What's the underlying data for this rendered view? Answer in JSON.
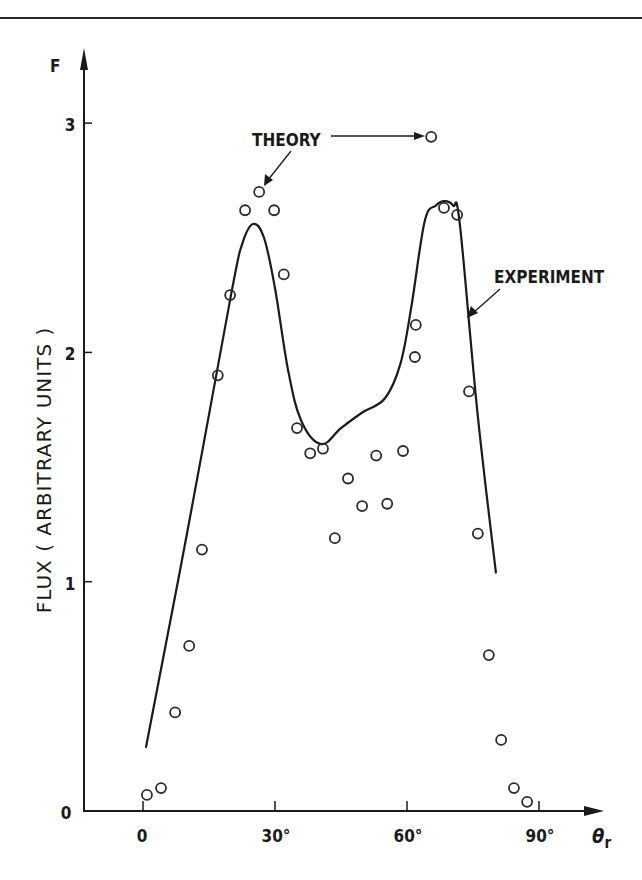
{
  "chart_data": {
    "type": "scatter",
    "title": "",
    "xlabel": "θr",
    "ylabel": "FLUX ( ARBITRARY UNITS )",
    "y_axis_symbol": "F",
    "xlim": [
      -13,
      96
    ],
    "ylim": [
      0,
      3.3
    ],
    "x_ticks": [
      0,
      30,
      60,
      90
    ],
    "x_tick_labels": [
      "0",
      "30°",
      "60°",
      "90°"
    ],
    "y_ticks": [
      0,
      1,
      2,
      3
    ],
    "y_tick_labels": [
      "0",
      "1",
      "2",
      "3"
    ],
    "grid": false,
    "legend": "none (inline annotations)",
    "annotations": [
      {
        "text": "THEORY",
        "points_to": "open-circle markers"
      },
      {
        "text": "EXPERIMENT",
        "points_to": "solid line"
      }
    ],
    "series": [
      {
        "name": "THEORY",
        "style": "open circles",
        "x": [
          0.9,
          4.1,
          7.3,
          10.5,
          13.4,
          17.0,
          19.8,
          23.2,
          26.4,
          29.8,
          32.0,
          35.0,
          38.0,
          40.9,
          43.6,
          46.6,
          49.8,
          53.0,
          55.5,
          59.1,
          61.8,
          62.0,
          65.5,
          68.4,
          71.4,
          74.1,
          76.1,
          78.6,
          81.4,
          84.3,
          87.3
        ],
        "y": [
          0.07,
          0.1,
          0.43,
          0.72,
          1.14,
          1.9,
          2.25,
          2.62,
          2.7,
          2.62,
          2.34,
          1.67,
          1.56,
          1.58,
          1.19,
          1.45,
          1.33,
          1.55,
          1.34,
          1.57,
          1.98,
          2.12,
          2.94,
          2.63,
          2.6,
          1.83,
          1.21,
          0.68,
          0.31,
          0.1,
          0.04
        ]
      },
      {
        "name": "EXPERIMENT",
        "style": "solid line",
        "x": [
          0.7,
          10,
          20,
          22.5,
          25,
          27.5,
          30,
          33,
          36,
          40.5,
          45,
          50,
          55,
          58.5,
          61,
          64,
          66.5,
          68.5,
          70.5,
          72,
          76,
          80.2
        ],
        "y": [
          0.28,
          1.21,
          2.25,
          2.47,
          2.56,
          2.5,
          2.28,
          1.92,
          1.7,
          1.6,
          1.67,
          1.74,
          1.8,
          1.95,
          2.2,
          2.57,
          2.64,
          2.66,
          2.64,
          2.56,
          1.74,
          1.04
        ]
      }
    ]
  },
  "labels": {
    "theory": "THEORY",
    "experiment": "EXPERIMENT",
    "y_symbol": "F",
    "x_symbol": "θ",
    "x_symbol_sub": "r",
    "y_title": "FLUX ( ARBITRARY UNITS )",
    "x_ticks": [
      "0",
      "30°",
      "60°",
      "90°"
    ],
    "y_ticks": [
      "0",
      "1",
      "2",
      "3"
    ]
  },
  "colors": {
    "ink": "#1a1a1a",
    "background": "#ffffff"
  }
}
